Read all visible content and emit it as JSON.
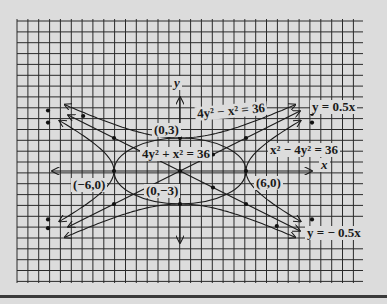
{
  "figure": {
    "axes": {
      "x_label": "x",
      "y_label": "y"
    },
    "equations": {
      "ellipse": "4y² + x² = 36",
      "hyperbola_vertical": "4y² − x² = 36",
      "hyperbola_horizontal": "x² − 4y² = 36",
      "asymptote_positive": "y = 0.5x",
      "asymptote_negative": "y = − 0.5x"
    },
    "points": {
      "top": "(0,3)",
      "bottom": "(0,−3)",
      "left": "(−6,0)",
      "right": "(6,0)"
    },
    "colors": {
      "background": "#dcdcdc",
      "grid": "#2a2a2a",
      "ink": "#1a1a1a"
    }
  }
}
